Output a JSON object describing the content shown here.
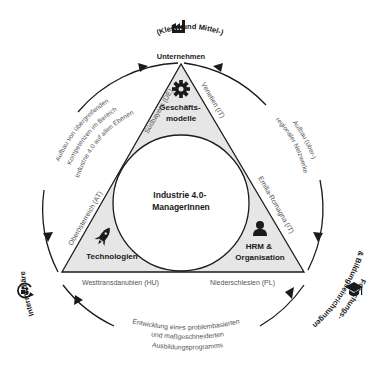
{
  "center": {
    "line1": "Industrie 4.0-",
    "line2": "ManagerInnen"
  },
  "corners": {
    "top": {
      "line1": "Geschäfts-",
      "line2": "modelle",
      "icon": "gear-icon"
    },
    "left": {
      "line1": "Technologien",
      "icon": "rocket-icon"
    },
    "right": {
      "line1": "HRM &",
      "line2": "Organisation",
      "icon": "person-icon"
    }
  },
  "regions": {
    "top_left_edge": "Südbayern (DE)",
    "top_right_edge": "Venetien (IT)",
    "left_edge": "Oberösterreich (AT)",
    "right_edge": "Emilia-Romagna (IT)",
    "bottom_left": "Westtransdanubien (HU)",
    "bottom_right": "Niederschlesien (PL)"
  },
  "stakeholders": {
    "top": {
      "line1": "(Klein- und Mittel-)",
      "line2": "Unternehmen",
      "icon": "factory-icon"
    },
    "left": {
      "line1": "Intermediäre",
      "icon": "people-cycle-icon"
    },
    "right": {
      "line1": "Forschungs-",
      "line2": "& Bildungseinrichtungen",
      "icon": "graduation-cap-icon"
    }
  },
  "outcomes": {
    "left": [
      "Aufbau von übergreifenden",
      "Kompetenzen im Bereich",
      "Industrie 4.0 auf allen Ebenen"
    ],
    "right": [
      "Aufbau (über-)",
      "regionaler Netzwerke"
    ],
    "bottom": [
      "Entwicklung eines problembasierten",
      "und maßgeschneiderten",
      "Ausbildungsprogramms"
    ]
  },
  "colors": {
    "triangle_fill": "#e6e6e6",
    "stroke": "#1a1a1a",
    "region_text": "#555555"
  }
}
